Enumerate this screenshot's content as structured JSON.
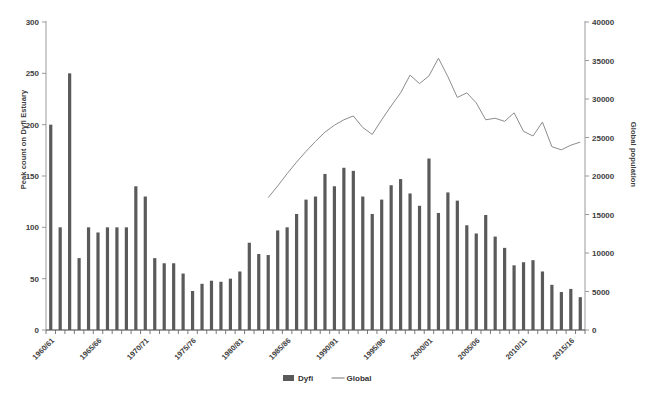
{
  "chart_data": {
    "type": "bar",
    "title": "",
    "xlabel": "",
    "ylabel": "Peak count on Dyfi Estuary",
    "y2label": "Global population",
    "ylim": [
      0,
      300
    ],
    "y2lim": [
      0,
      40000
    ],
    "yticks": [
      0,
      50,
      100,
      150,
      200,
      250,
      300
    ],
    "y2ticks": [
      0,
      5000,
      10000,
      15000,
      20000,
      25000,
      30000,
      35000,
      40000
    ],
    "grid": false,
    "legend_position": "bottom",
    "bar_color": "#5a5a5a",
    "line_color": "#8c8c8c",
    "categories": [
      "1960/61",
      "1961/62",
      "1962/63",
      "1963/64",
      "1964/65",
      "1965/66",
      "1966/67",
      "1967/68",
      "1968/69",
      "1969/70",
      "1970/71",
      "1971/72",
      "1972/73",
      "1973/74",
      "1974/75",
      "1975/76",
      "1976/77",
      "1977/78",
      "1978/79",
      "1979/80",
      "1980/81",
      "1981/82",
      "1982/83",
      "1983/84",
      "1984/85",
      "1985/86",
      "1986/87",
      "1987/88",
      "1988/89",
      "1989/90",
      "1990/91",
      "1991/92",
      "1992/93",
      "1993/94",
      "1994/95",
      "1995/96",
      "1996/97",
      "1997/98",
      "1998/99",
      "1999/00",
      "2000/01",
      "2001/02",
      "2002/03",
      "2003/04",
      "2004/05",
      "2005/06",
      "2006/07",
      "2007/08",
      "2008/09",
      "2009/10",
      "2010/11",
      "2011/12",
      "2012/13",
      "2013/14",
      "2014/15",
      "2015/16",
      "2016/17"
    ],
    "xtick_labels": [
      "1960/61",
      "1965/66",
      "1970/71",
      "1975/76",
      "1980/81",
      "1985/86",
      "1990/91",
      "1995/96",
      "2000/01",
      "2005/06",
      "2010/11",
      "2015/16"
    ],
    "xtick_indices": [
      0,
      5,
      10,
      15,
      20,
      25,
      30,
      35,
      40,
      45,
      50,
      55
    ],
    "series": [
      {
        "name": "Dyfi",
        "type": "bar",
        "axis": "left",
        "values": [
          200,
          100,
          250,
          70,
          100,
          95,
          100,
          100,
          100,
          140,
          130,
          70,
          65,
          65,
          55,
          38,
          45,
          48,
          47,
          50,
          57,
          85,
          74,
          73,
          97,
          100,
          113,
          127,
          130,
          152,
          140,
          158,
          155,
          130,
          113,
          127,
          141,
          147,
          133,
          121,
          167,
          114,
          134,
          126,
          102,
          94,
          112,
          91,
          80,
          63,
          66,
          68,
          57,
          44,
          37,
          40,
          32
        ]
      },
      {
        "name": "Global",
        "type": "line",
        "axis": "right",
        "values": [
          null,
          null,
          null,
          null,
          null,
          null,
          null,
          null,
          null,
          null,
          null,
          null,
          null,
          null,
          null,
          null,
          null,
          null,
          null,
          null,
          null,
          null,
          null,
          17200,
          18700,
          20300,
          21800,
          23200,
          24500,
          25700,
          26600,
          27300,
          27800,
          26300,
          25400,
          27300,
          29100,
          30800,
          33100,
          32000,
          33000,
          35300,
          32900,
          30200,
          30800,
          29500,
          27300,
          27500,
          27100,
          28200,
          25800,
          25200,
          27000,
          23800,
          23400,
          24000,
          24400
        ]
      }
    ]
  },
  "legend": {
    "items": [
      {
        "label": "Dyfi",
        "marker": "bar",
        "color": "#5a5a5a"
      },
      {
        "label": "Global",
        "marker": "line",
        "color": "#8c8c8c"
      }
    ]
  }
}
